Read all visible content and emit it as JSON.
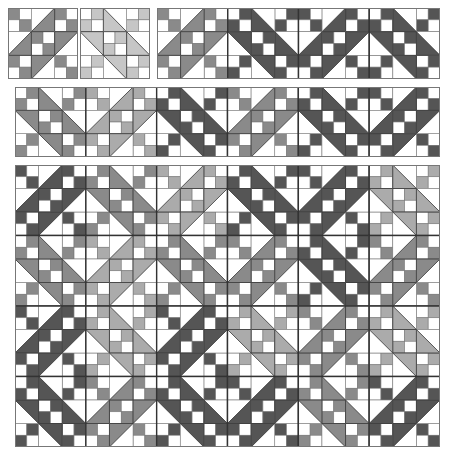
{
  "colors": {
    "background": "#ffffff",
    "line": "#333333",
    "thin_line": "#777777",
    "shades": {
      "dark": "#555555",
      "medium": "#8a8a8a",
      "light": "#ababab",
      "pale": "#c6c6c6"
    }
  },
  "panels": [
    {
      "name": "single-block-slash",
      "x": 8,
      "y": 8,
      "w": 70,
      "h": 71,
      "rows": [
        [
          {
            "o": "/",
            "s": "medium"
          }
        ]
      ]
    },
    {
      "name": "single-block-backslash",
      "x": 80,
      "y": 8,
      "w": 70,
      "h": 71,
      "rows": [
        [
          {
            "o": "\\",
            "s": "pale"
          }
        ]
      ]
    },
    {
      "name": "strip-four-blocks",
      "x": 157,
      "y": 8,
      "w": 283,
      "h": 71,
      "rows": [
        [
          {
            "o": "/",
            "s": "medium"
          },
          {
            "o": "\\",
            "s": "dark"
          },
          {
            "o": "/",
            "s": "dark"
          },
          {
            "o": "\\",
            "s": "dark"
          }
        ]
      ]
    },
    {
      "name": "strip-six-blocks",
      "x": 15,
      "y": 87,
      "w": 425,
      "h": 70,
      "rows": [
        [
          {
            "o": "\\",
            "s": "medium"
          },
          {
            "o": "/",
            "s": "light"
          },
          {
            "o": "\\",
            "s": "dark"
          },
          {
            "o": "/",
            "s": "medium"
          },
          {
            "o": "\\",
            "s": "dark"
          },
          {
            "o": "/",
            "s": "dark"
          }
        ]
      ]
    },
    {
      "name": "quilt-grid",
      "x": 15,
      "y": 165,
      "w": 425,
      "h": 282,
      "rows": [
        [
          {
            "o": "/",
            "s": "dark"
          },
          {
            "o": "\\",
            "s": "medium"
          },
          {
            "o": "/",
            "s": "light"
          },
          {
            "o": "\\",
            "s": "dark"
          },
          {
            "o": "/",
            "s": "dark"
          },
          {
            "o": "\\",
            "s": "light"
          }
        ],
        [
          {
            "o": "\\",
            "s": "medium"
          },
          {
            "o": "/",
            "s": "light"
          },
          {
            "o": "\\",
            "s": "medium"
          },
          {
            "o": "/",
            "s": "medium"
          },
          {
            "o": "\\",
            "s": "dark"
          },
          {
            "o": "/",
            "s": "medium"
          }
        ],
        [
          {
            "o": "/",
            "s": "dark"
          },
          {
            "o": "\\",
            "s": "light"
          },
          {
            "o": "/",
            "s": "dark"
          },
          {
            "o": "\\",
            "s": "light"
          },
          {
            "o": "/",
            "s": "medium"
          },
          {
            "o": "\\",
            "s": "light"
          }
        ],
        [
          {
            "o": "\\",
            "s": "dark"
          },
          {
            "o": "/",
            "s": "medium"
          },
          {
            "o": "\\",
            "s": "dark"
          },
          {
            "o": "/",
            "s": "dark"
          },
          {
            "o": "\\",
            "s": "medium"
          },
          {
            "o": "/",
            "s": "dark"
          }
        ]
      ]
    }
  ]
}
